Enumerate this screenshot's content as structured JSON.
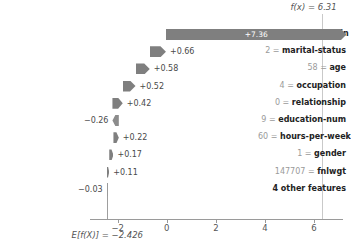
{
  "chart_data": {
    "type": "bar",
    "chart_variant": "shap-waterfall",
    "title": "",
    "xlabel": "",
    "ylabel": "",
    "xlim": [
      -3.05,
      7.1
    ],
    "grid": false,
    "base_value": -2.426,
    "base_value_label": "E[f(X)] = −2.426",
    "output_value": 6.31,
    "output_value_label": "f(x) = 6.31",
    "axis_ticks": [
      -2,
      0,
      2,
      4,
      6
    ],
    "axis_tick_labels": [
      "−2",
      "0",
      "2",
      "4",
      "6"
    ],
    "colors": {
      "positive_bar": "#7f7f7f",
      "negative_bar": "#8c8c8c",
      "axis": "#9a9a9a",
      "label_value": "#9a9a9a",
      "label_name": "#222222",
      "bar_label_inside": "#ffffff",
      "bar_label_outside": "#4a4a4a"
    },
    "categories": [
      "capital-gain",
      "marital-status",
      "age",
      "occupation",
      "relationship",
      "education-num",
      "hours-per-week",
      "gender",
      "fnlwgt",
      "4 other features"
    ],
    "values": [
      7.36,
      0.66,
      0.58,
      0.52,
      0.42,
      -0.26,
      0.22,
      0.17,
      0.11,
      -0.03
    ],
    "rows": [
      {
        "feature_value": "15024",
        "eq": "=",
        "feature_name": "capital-gain",
        "value": 7.36,
        "value_label": "+7.36",
        "label_inside": true
      },
      {
        "feature_value": "2",
        "eq": "=",
        "feature_name": "marital-status",
        "value": 0.66,
        "value_label": "+0.66",
        "label_inside": false
      },
      {
        "feature_value": "58",
        "eq": "=",
        "feature_name": "age",
        "value": 0.58,
        "value_label": "+0.58",
        "label_inside": false
      },
      {
        "feature_value": "4",
        "eq": "=",
        "feature_name": "occupation",
        "value": 0.52,
        "value_label": "+0.52",
        "label_inside": false
      },
      {
        "feature_value": "0",
        "eq": "=",
        "feature_name": "relationship",
        "value": 0.42,
        "value_label": "+0.42",
        "label_inside": false
      },
      {
        "feature_value": "9",
        "eq": "=",
        "feature_name": "education-num",
        "value": -0.26,
        "value_label": "−0.26",
        "label_inside": false
      },
      {
        "feature_value": "60",
        "eq": "=",
        "feature_name": "hours-per-week",
        "value": 0.22,
        "value_label": "+0.22",
        "label_inside": false
      },
      {
        "feature_value": "1",
        "eq": "=",
        "feature_name": "gender",
        "value": 0.17,
        "value_label": "+0.17",
        "label_inside": false
      },
      {
        "feature_value": "147707",
        "eq": "=",
        "feature_name": "fnlwgt",
        "value": 0.11,
        "value_label": "+0.11",
        "label_inside": false
      },
      {
        "feature_value": "",
        "eq": "",
        "feature_name": "4 other features",
        "value": -0.03,
        "value_label": "−0.03",
        "label_inside": false
      }
    ]
  }
}
